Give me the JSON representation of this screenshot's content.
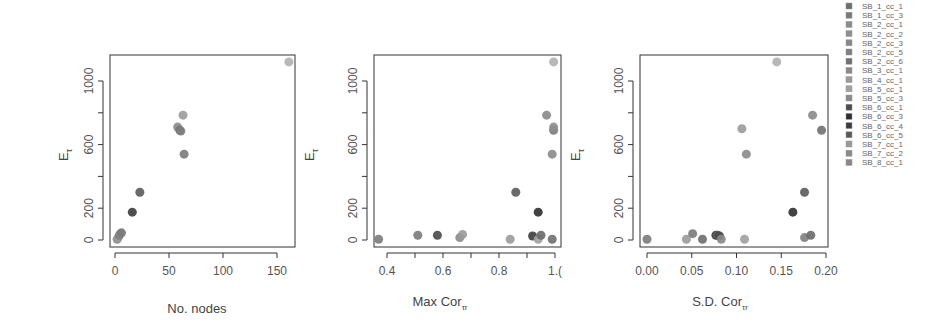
{
  "chart_data": [
    {
      "type": "scatter",
      "title": "",
      "xlabel": "No. nodes",
      "ylabel": "E_τ",
      "xlim": [
        -3,
        168
      ],
      "ylim": [
        -40,
        1150
      ],
      "xticks": [
        0,
        50,
        100,
        150
      ],
      "xtick_labels": [
        "0",
        "50",
        "100",
        "150"
      ],
      "yticks": [
        0,
        200,
        400,
        600,
        800,
        1000
      ],
      "ytick_labels": [
        "0",
        "",
        "200",
        "",
        "600",
        "",
        "1000"
      ],
      "grid": false,
      "points": [
        {
          "x": 2,
          "y": 5,
          "color": "#8a8a8a"
        },
        {
          "x": 3,
          "y": 15,
          "color": "#9a9a9a"
        },
        {
          "x": 4,
          "y": 30,
          "color": "#7d7d7d"
        },
        {
          "x": 5,
          "y": 40,
          "color": "#888888"
        },
        {
          "x": 6,
          "y": 45,
          "color": "#7a7a7a"
        },
        {
          "x": 16,
          "y": 175,
          "color": "#3c3c3c"
        },
        {
          "x": 23,
          "y": 300,
          "color": "#5a5a5a"
        },
        {
          "x": 58,
          "y": 710,
          "color": "#8a8a8a"
        },
        {
          "x": 60,
          "y": 690,
          "color": "#707070"
        },
        {
          "x": 61,
          "y": 685,
          "color": "#7e7e7e"
        },
        {
          "x": 63,
          "y": 785,
          "color": "#9a9a9a"
        },
        {
          "x": 64,
          "y": 540,
          "color": "#7a7a7a"
        },
        {
          "x": 161,
          "y": 1120,
          "color": "#b0b0b0"
        }
      ]
    },
    {
      "type": "scatter",
      "title": "",
      "xlabel": "Max Cor_τr",
      "ylabel": "E_τ",
      "xlim": [
        0.36,
        1.01
      ],
      "ylim": [
        -40,
        1150
      ],
      "xticks": [
        0.4,
        0.5,
        0.6,
        0.7,
        0.8,
        0.9,
        1.0
      ],
      "xtick_labels": [
        "0.4",
        "",
        "0.6",
        "",
        "0.8",
        "",
        "1.0"
      ],
      "yticks": [
        0,
        200,
        400,
        600,
        800,
        1000
      ],
      "grid": false,
      "points": [
        {
          "x": 0.37,
          "y": 5,
          "color": "#7a7a7a"
        },
        {
          "x": 0.51,
          "y": 30,
          "color": "#7a7a7a"
        },
        {
          "x": 0.58,
          "y": 30,
          "color": "#4a4a4a"
        },
        {
          "x": 0.66,
          "y": 15,
          "color": "#888888"
        },
        {
          "x": 0.67,
          "y": 35,
          "color": "#9a9a9a"
        },
        {
          "x": 0.84,
          "y": 5,
          "color": "#9a9a9a"
        },
        {
          "x": 0.86,
          "y": 300,
          "color": "#5a5a5a"
        },
        {
          "x": 0.92,
          "y": 25,
          "color": "#3c3c3c"
        },
        {
          "x": 0.94,
          "y": 175,
          "color": "#2e2e2e"
        },
        {
          "x": 0.94,
          "y": 5,
          "color": "#a0a0a0"
        },
        {
          "x": 0.95,
          "y": 30,
          "color": "#6a6a6a"
        },
        {
          "x": 0.97,
          "y": 785,
          "color": "#8a8a8a"
        },
        {
          "x": 0.99,
          "y": 5,
          "color": "#6e6e6e"
        },
        {
          "x": 0.99,
          "y": 540,
          "color": "#8a8a8a"
        },
        {
          "x": 0.995,
          "y": 690,
          "color": "#7a7a7a"
        },
        {
          "x": 0.995,
          "y": 710,
          "color": "#8e8e8e"
        },
        {
          "x": 0.995,
          "y": 1120,
          "color": "#b0b0b0"
        }
      ]
    },
    {
      "type": "scatter",
      "title": "",
      "xlabel": "S.D. Cor_τr",
      "ylabel": "E_τ",
      "xlim": [
        -0.005,
        0.202
      ],
      "ylim": [
        -40,
        1150
      ],
      "xticks": [
        0.0,
        0.05,
        0.1,
        0.15,
        0.2
      ],
      "xtick_labels": [
        "0.00",
        "0.05",
        "0.10",
        "0.15",
        "0.20"
      ],
      "yticks": [
        0,
        200,
        400,
        600,
        800,
        1000
      ],
      "grid": false,
      "points": [
        {
          "x": 0.0,
          "y": 5,
          "color": "#7a7a7a"
        },
        {
          "x": 0.044,
          "y": 5,
          "color": "#9a9a9a"
        },
        {
          "x": 0.051,
          "y": 40,
          "color": "#7a7a7a"
        },
        {
          "x": 0.062,
          "y": 5,
          "color": "#6e6e6e"
        },
        {
          "x": 0.077,
          "y": 30,
          "color": "#3c3c3c"
        },
        {
          "x": 0.079,
          "y": 30,
          "color": "#5a5a5a"
        },
        {
          "x": 0.081,
          "y": 25,
          "color": "#4a4a4a"
        },
        {
          "x": 0.083,
          "y": 5,
          "color": "#8a8a8a"
        },
        {
          "x": 0.106,
          "y": 700,
          "color": "#9a9a9a"
        },
        {
          "x": 0.109,
          "y": 5,
          "color": "#a0a0a0"
        },
        {
          "x": 0.111,
          "y": 540,
          "color": "#8a8a8a"
        },
        {
          "x": 0.145,
          "y": 1120,
          "color": "#b0b0b0"
        },
        {
          "x": 0.163,
          "y": 175,
          "color": "#2e2e2e"
        },
        {
          "x": 0.176,
          "y": 300,
          "color": "#5a5a5a"
        },
        {
          "x": 0.176,
          "y": 15,
          "color": "#7e7e7e"
        },
        {
          "x": 0.183,
          "y": 30,
          "color": "#6a6a6a"
        },
        {
          "x": 0.185,
          "y": 785,
          "color": "#8a8a8a"
        },
        {
          "x": 0.195,
          "y": 690,
          "color": "#707070"
        }
      ]
    }
  ],
  "legend": {
    "position": "top-right",
    "entries": [
      {
        "label": "SB_1_cc_1",
        "color": "#6e6e6e"
      },
      {
        "label": "SB_1_cc_3",
        "color": "#7a7a7a"
      },
      {
        "label": "SB_2_cc_1",
        "color": "#8a8a8a"
      },
      {
        "label": "SB_2_cc_2",
        "color": "#8e8e8e"
      },
      {
        "label": "SB_2_cc_3",
        "color": "#888888"
      },
      {
        "label": "SB_2_cc_5",
        "color": "#7e7e7e"
      },
      {
        "label": "SB_2_cc_6",
        "color": "#707070"
      },
      {
        "label": "SB_3_cc_1",
        "color": "#8a8a8a"
      },
      {
        "label": "SB_4_cc_1",
        "color": "#9a9a9a"
      },
      {
        "label": "SB_5_cc_1",
        "color": "#a0a0a0"
      },
      {
        "label": "SB_5_cc_3",
        "color": "#8a8a8a"
      },
      {
        "label": "SB_6_cc_1",
        "color": "#4a4a4a"
      },
      {
        "label": "SB_6_cc_3",
        "color": "#2e2e2e"
      },
      {
        "label": "SB_6_cc_4",
        "color": "#3c3c3c"
      },
      {
        "label": "SB_6_cc_5",
        "color": "#5a5a5a"
      },
      {
        "label": "SB_7_cc_1",
        "color": "#9a9a9a"
      },
      {
        "label": "SB_7_cc_2",
        "color": "#8a8a8a"
      },
      {
        "label": "SB_8_cc_1",
        "color": "#888888"
      }
    ]
  },
  "panels": [
    {
      "xlabel_main": "No. nodes",
      "xlabel_sub": "",
      "ylabel_main": "E",
      "ylabel_sub": "τ"
    },
    {
      "xlabel_main": "Max   Cor",
      "xlabel_sub": "τr",
      "ylabel_main": "E",
      "ylabel_sub": "τ"
    },
    {
      "xlabel_main": "S.D.   Cor",
      "xlabel_sub": "τr",
      "ylabel_main": "E",
      "ylabel_sub": "τ"
    }
  ],
  "y_tick_labels": [
    "0",
    "200",
    "600",
    "1000"
  ]
}
